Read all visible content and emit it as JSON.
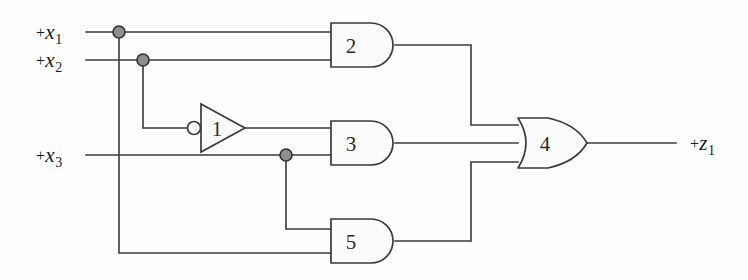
{
  "diagram": {
    "type": "logic-gate-schematic",
    "colors": {
      "wire": "#3a3a3a",
      "gate_stroke": "#3a3a3a",
      "gate_fill": "#fbfbfb",
      "junction_fill": "#8e8e8e",
      "junction_stroke": "#2f2f2f",
      "text": "#1a1a1a",
      "background": "#fefefe"
    },
    "inputs": [
      {
        "id": "x1",
        "op": "+",
        "var": "x",
        "sub": "1",
        "y": 32
      },
      {
        "id": "x2",
        "op": "+",
        "var": "x",
        "sub": "2",
        "y": 60
      },
      {
        "id": "x3",
        "op": "+",
        "var": "x",
        "sub": "3",
        "y": 155
      }
    ],
    "outputs": [
      {
        "id": "z1",
        "op": "+",
        "var": "z",
        "sub": "1",
        "y": 143
      }
    ],
    "gates": [
      {
        "id": "g1",
        "number": "1",
        "kind": "inverter",
        "x": 200,
        "y": 128
      },
      {
        "id": "g2",
        "number": "2",
        "kind": "and",
        "x": 331,
        "y": 45
      },
      {
        "id": "g3",
        "number": "3",
        "kind": "and",
        "x": 331,
        "y": 143
      },
      {
        "id": "g4",
        "number": "4",
        "kind": "or",
        "x": 518,
        "y": 143
      },
      {
        "id": "g5",
        "number": "5",
        "kind": "and",
        "x": 331,
        "y": 241
      }
    ],
    "junctions": [
      {
        "id": "j-x1",
        "x": 119,
        "y": 32
      },
      {
        "id": "j-x2",
        "x": 143,
        "y": 60
      },
      {
        "id": "j-x3",
        "x": 286,
        "y": 155
      }
    ],
    "connections": [
      {
        "from": "x1",
        "to": "g2.in1"
      },
      {
        "from": "x1",
        "to": "g5.in2"
      },
      {
        "from": "x2",
        "to": "g2.in2"
      },
      {
        "from": "x2",
        "to": "g1.in"
      },
      {
        "from": "g1.out",
        "to": "g3.in1"
      },
      {
        "from": "x3",
        "to": "g3.in2"
      },
      {
        "from": "x3",
        "to": "g5.in1"
      },
      {
        "from": "g2.out",
        "to": "g4.in1"
      },
      {
        "from": "g3.out",
        "to": "g4.in2"
      },
      {
        "from": "g5.out",
        "to": "g4.in3"
      },
      {
        "from": "g4.out",
        "to": "z1"
      }
    ]
  }
}
